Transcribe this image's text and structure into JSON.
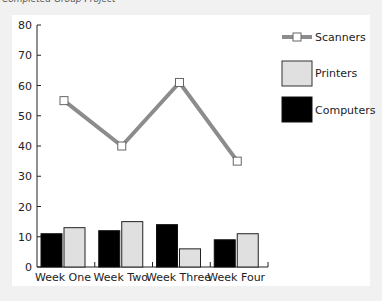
{
  "title": "Completed Group Project",
  "chart_data": {
    "type": "bar",
    "title": "Completed Group Project",
    "xlabel": "",
    "ylabel": "",
    "categories": [
      "Week One",
      "Week Two",
      "Week Three",
      "Week Four"
    ],
    "series": [
      {
        "name": "Computers",
        "type": "bar",
        "color": "#000000",
        "values": [
          11,
          12,
          14,
          9
        ]
      },
      {
        "name": "Printers",
        "type": "bar",
        "color": "#e0e0e0",
        "values": [
          13,
          15,
          6,
          11
        ]
      },
      {
        "name": "Scanners",
        "type": "line",
        "color": "#8c8c8c",
        "values": [
          55,
          40,
          61,
          35
        ]
      }
    ],
    "ylim": [
      0,
      80
    ],
    "yticks": [
      0,
      10,
      20,
      30,
      40,
      50,
      60,
      70,
      80
    ],
    "grid": false,
    "legend_position": "right",
    "legend": [
      "Scanners",
      "Printers",
      "Computers"
    ]
  },
  "colors": {
    "background": "#f1f1f1",
    "panel": "#ffffff",
    "computers": "#000000",
    "printers": "#e0e0e0",
    "scanners": "#8c8c8c"
  }
}
